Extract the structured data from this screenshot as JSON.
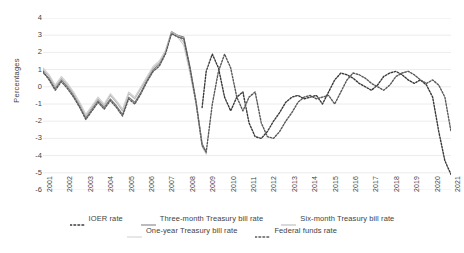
{
  "chart_data": {
    "type": "line",
    "title": "",
    "xlabel": "",
    "ylabel": "Percentages",
    "ylim": [
      -6,
      4
    ],
    "ytick_values": [
      4,
      3,
      2,
      1,
      0,
      -1,
      -2,
      -3,
      -4,
      -5,
      -6
    ],
    "ytick_labels": [
      "4",
      "3",
      "2",
      "1",
      "0",
      "-1",
      "-2",
      "-3",
      "-4",
      "-5",
      "-6"
    ],
    "xlim": [
      2001,
      2021
    ],
    "categories": [
      "2001",
      "2002",
      "2003",
      "2004",
      "2005",
      "2006",
      "2007",
      "2008",
      "2009",
      "2010",
      "2011",
      "2012",
      "2013",
      "2014",
      "2015",
      "2016",
      "2017",
      "2018",
      "2019",
      "2020",
      "2021"
    ],
    "grid": "horizontal",
    "legend_position": "bottom",
    "series": [
      {
        "name": "IOER rate",
        "style": "dotted",
        "color": "#3a3a3a",
        "x": [
          2008.8,
          2009.0,
          2009.3,
          2009.6,
          2009.9,
          2010.2,
          2010.5,
          2010.8,
          2011.1,
          2011.4,
          2011.7,
          2012.0,
          2012.3,
          2012.6,
          2012.9,
          2013.2,
          2013.5,
          2013.8,
          2014.1,
          2014.4,
          2014.7,
          2015.0,
          2015.3,
          2015.6,
          2015.9,
          2016.2,
          2016.5,
          2016.8,
          2017.1,
          2017.4,
          2017.7,
          2018.0,
          2018.3,
          2018.6,
          2018.9,
          2019.2,
          2019.5,
          2019.8,
          2020.1,
          2020.4,
          2020.7,
          2021.0
        ],
        "values": [
          -1.2,
          0.9,
          1.9,
          1.1,
          -0.6,
          -1.4,
          -0.6,
          -0.3,
          -2.1,
          -2.9,
          -3.0,
          -2.6,
          -2.0,
          -1.5,
          -0.9,
          -0.6,
          -0.5,
          -0.7,
          -0.6,
          -0.5,
          -1.0,
          -0.3,
          0.4,
          0.8,
          0.7,
          0.5,
          0.2,
          0.0,
          -0.2,
          0.1,
          0.6,
          0.8,
          0.9,
          0.7,
          0.4,
          0.2,
          0.4,
          0.1,
          -0.6,
          -2.6,
          -4.3,
          -5.1
        ]
      },
      {
        "name": "Three-month Treasury bill rate",
        "style": "solid",
        "color": "#7a7a7a",
        "x": [
          2001.0,
          2001.3,
          2001.6,
          2001.9,
          2002.2,
          2002.5,
          2002.8,
          2003.1,
          2003.4,
          2003.7,
          2004.0,
          2004.3,
          2004.6,
          2004.9,
          2005.2,
          2005.5,
          2005.8,
          2006.1,
          2006.4,
          2006.7,
          2007.0,
          2007.3,
          2007.6,
          2007.9,
          2008.2,
          2008.5,
          2008.8,
          2009.0
        ],
        "values": [
          0.8,
          0.5,
          -0.1,
          0.4,
          0.0,
          -0.5,
          -1.1,
          -1.8,
          -1.3,
          -0.8,
          -1.2,
          -0.7,
          -1.1,
          -1.6,
          -0.6,
          -0.9,
          -0.3,
          0.4,
          1.0,
          1.3,
          2.0,
          3.2,
          3.0,
          2.9,
          1.2,
          -0.8,
          -3.3,
          -3.8
        ]
      },
      {
        "name": "Six-month Treasury bill rate",
        "style": "solid",
        "color": "#b4b4b4",
        "x": [
          2001.0,
          2001.3,
          2001.6,
          2001.9,
          2002.2,
          2002.5,
          2002.8,
          2003.1,
          2003.4,
          2003.7,
          2004.0,
          2004.3,
          2004.6,
          2004.9,
          2005.2,
          2005.5,
          2005.8,
          2006.1,
          2006.4,
          2006.7,
          2007.0,
          2007.3,
          2007.6,
          2007.9,
          2008.2,
          2008.5,
          2008.8,
          2009.0
        ],
        "values": [
          1.0,
          0.6,
          0.0,
          0.5,
          0.1,
          -0.4,
          -1.0,
          -1.7,
          -1.2,
          -0.7,
          -1.1,
          -0.5,
          -0.9,
          -1.4,
          -0.4,
          -0.7,
          -0.1,
          0.5,
          1.1,
          1.4,
          2.1,
          3.2,
          3.0,
          2.6,
          1.0,
          -0.9,
          -3.4,
          -3.9
        ]
      },
      {
        "name": "One-year Treasury bill rate",
        "style": "solid",
        "color": "#cfcfcf",
        "x": [
          2001.0,
          2001.3,
          2001.6,
          2001.9,
          2002.2,
          2002.5,
          2002.8,
          2003.1,
          2003.4,
          2003.7,
          2004.0,
          2004.3,
          2004.6,
          2004.9,
          2005.2,
          2005.5,
          2005.8,
          2006.1,
          2006.4,
          2006.7,
          2007.0,
          2007.3,
          2007.6,
          2007.9,
          2008.2,
          2008.5,
          2008.8,
          2009.0
        ],
        "values": [
          1.1,
          0.7,
          0.1,
          0.6,
          0.2,
          -0.3,
          -0.9,
          -1.6,
          -1.1,
          -0.6,
          -1.0,
          -0.4,
          -0.8,
          -1.3,
          -0.3,
          -0.6,
          0.0,
          0.6,
          1.2,
          1.5,
          2.1,
          3.1,
          2.9,
          2.4,
          0.8,
          -1.0,
          -3.5,
          -3.9
        ]
      },
      {
        "name": "Federal funds rate",
        "style": "dotted",
        "color": "#5a5a5a",
        "x": [
          2001.0,
          2001.3,
          2001.6,
          2001.9,
          2002.2,
          2002.5,
          2002.8,
          2003.1,
          2003.4,
          2003.7,
          2004.0,
          2004.3,
          2004.6,
          2004.9,
          2005.2,
          2005.5,
          2005.8,
          2006.1,
          2006.4,
          2006.7,
          2007.0,
          2007.3,
          2007.6,
          2007.9,
          2008.2,
          2008.5,
          2008.8,
          2009.0,
          2009.3,
          2009.6,
          2009.9,
          2010.2,
          2010.5,
          2010.8,
          2011.1,
          2011.4,
          2011.7,
          2012.0,
          2012.3,
          2012.6,
          2012.9,
          2013.2,
          2013.5,
          2013.8,
          2014.1,
          2014.4,
          2014.7,
          2015.0,
          2015.3,
          2015.6,
          2015.9,
          2016.2,
          2016.5,
          2016.8,
          2017.1,
          2017.4,
          2017.7,
          2018.0,
          2018.3,
          2018.6,
          2018.9,
          2019.2,
          2019.5,
          2019.8,
          2020.1,
          2020.4,
          2020.7,
          2021.0
        ],
        "values": [
          0.9,
          0.4,
          -0.2,
          0.3,
          -0.1,
          -0.6,
          -1.2,
          -1.9,
          -1.4,
          -0.9,
          -1.3,
          -0.8,
          -1.2,
          -1.7,
          -0.7,
          -1.0,
          -0.4,
          0.3,
          0.9,
          1.2,
          1.9,
          3.1,
          2.9,
          2.8,
          1.1,
          -0.9,
          -3.4,
          -3.8,
          -1.0,
          0.9,
          1.9,
          1.1,
          -0.6,
          -1.4,
          -0.6,
          -0.3,
          -2.1,
          -2.9,
          -3.0,
          -2.6,
          -2.0,
          -1.5,
          -0.9,
          -0.6,
          -0.5,
          -0.7,
          -0.6,
          -0.5,
          -1.0,
          -0.3,
          0.4,
          0.8,
          0.7,
          0.5,
          0.2,
          0.0,
          -0.2,
          0.1,
          0.6,
          0.8,
          0.9,
          0.7,
          0.4,
          0.2,
          0.4,
          0.1,
          -0.6,
          -2.6
        ]
      }
    ]
  },
  "legend": {
    "rows": [
      [
        {
          "label": "IOER rate",
          "style": "dotted",
          "color": "#3a3a3a"
        },
        {
          "label": "Three-month Treasury bill rate",
          "style": "solid",
          "color": "#7a7a7a"
        },
        {
          "label": "Six-month Treasury bill rate",
          "style": "solid",
          "color": "#b4b4b4"
        }
      ],
      [
        {
          "label": "One-year Treasury bill rate",
          "style": "solid",
          "color": "#cfcfcf"
        },
        {
          "label": "Federal funds rate",
          "style": "dotted",
          "color": "#5a5a5a"
        }
      ]
    ]
  }
}
